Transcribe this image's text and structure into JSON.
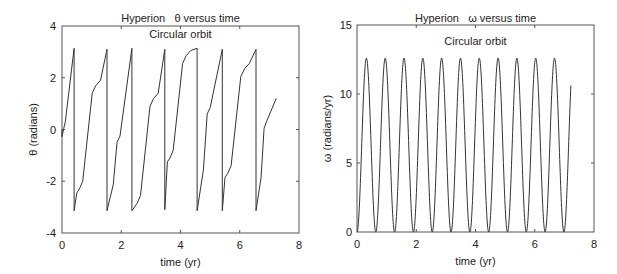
{
  "chart_data": [
    {
      "type": "line",
      "title": "Hyperion   θ versus time",
      "subtitle": "Circular orbit",
      "xlabel": "time (yr)",
      "ylabel": "θ (radians)",
      "xlim": [
        0,
        8
      ],
      "ylim": [
        -4,
        4
      ],
      "xticks": [
        0,
        2,
        4,
        6,
        8
      ],
      "yticks": [
        -4,
        -2,
        0,
        2,
        4
      ],
      "grid": false,
      "legend": null,
      "line_color": "#333333",
      "description": "Sawtooth-like angle wrapped to [-π, π]; rises from -π to π with plateaus, then jumps back to -π.",
      "segments": [
        {
          "t_start": 0.0,
          "t_end": 0.41,
          "theta_start": 0.0,
          "theta_end": 3.14,
          "plateau": 0.05
        },
        {
          "t_start": 0.41,
          "t_end": 1.52,
          "theta_start": -3.14,
          "theta_end": 3.1,
          "plateau_low": -2.3,
          "plateau_high": 1.7
        },
        {
          "t_start": 1.52,
          "t_end": 2.36,
          "theta_start": -3.14,
          "theta_end": 3.14,
          "plateau": -0.5
        },
        {
          "t_start": 2.36,
          "t_end": 3.47,
          "theta_start": -3.14,
          "theta_end": 3.1,
          "plateau_low": -2.85,
          "plateau_high": 1.2
        },
        {
          "t_start": 3.47,
          "t_end": 4.56,
          "theta_start": -3.1,
          "theta_end": 3.14,
          "plateau_low": -1.1,
          "plateau_high": 2.85
        },
        {
          "t_start": 4.56,
          "t_end": 5.41,
          "theta_start": -3.14,
          "theta_end": 3.1,
          "plateau": 0.6
        },
        {
          "t_start": 5.41,
          "t_end": 6.55,
          "theta_start": -3.14,
          "theta_end": 3.1,
          "plateau_low": -1.7,
          "plateau_high": 2.35
        },
        {
          "t_start": 6.55,
          "t_end": 7.23,
          "theta_start": -3.14,
          "theta_end": 1.2,
          "plateau": 0.05
        }
      ]
    },
    {
      "type": "line",
      "title": "Hyperion   ω versus time",
      "subtitle": "Circular orbit",
      "xlabel": "time (yr)",
      "ylabel": "ω (radians/yr)",
      "xlim": [
        0,
        8
      ],
      "ylim": [
        0,
        15
      ],
      "xticks": [
        0,
        2,
        4,
        6,
        8
      ],
      "yticks": [
        0,
        5,
        10,
        15
      ],
      "grid": false,
      "legend": null,
      "line_color": "#333333",
      "description": "Periodic oscillation between 0 and ~12.6 rad/yr, period ~0.635 yr, 11 full peaks, ending at t≈7.22 with ω≈10.8.",
      "amplitude_peak": 12.6,
      "minimum": 0,
      "period": 0.635,
      "t_end": 7.22,
      "end_value": 10.8,
      "peak_times": [
        0.32,
        0.95,
        1.59,
        2.22,
        2.86,
        3.49,
        4.13,
        4.76,
        5.4,
        6.03,
        6.67
      ]
    }
  ],
  "plots": {
    "left": {
      "title": "Hyperion   θ versus time",
      "subtitle": "Circular orbit",
      "xlabel": "time (yr)",
      "ylabel": "θ (radians)",
      "xtick_labels": [
        "0",
        "2",
        "4",
        "6",
        "8"
      ],
      "ytick_labels": [
        "4",
        "2",
        "0",
        "-2",
        "-4"
      ]
    },
    "right": {
      "title": "Hyperion   ω versus time",
      "subtitle": "Circular orbit",
      "xlabel": "time (yr)",
      "ylabel": "ω (radians/yr)",
      "xtick_labels": [
        "0",
        "2",
        "4",
        "6",
        "8"
      ],
      "ytick_labels": [
        "15",
        "10",
        "5",
        "0"
      ]
    }
  }
}
